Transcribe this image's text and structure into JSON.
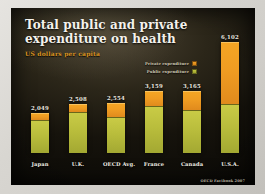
{
  "slide": {
    "title_line1": "Total public and private",
    "title_line2": "expenditure on health",
    "subtitle": "US dollars per capita",
    "source_note": "OECD Factbook 2007"
  },
  "legend": {
    "private_label": "Private expenditure",
    "public_label": "Public expenditure",
    "private_swatch_name": "private-expenditure-swatch",
    "public_swatch_name": "public-expenditure-swatch"
  },
  "colors": {
    "private": "#ef9c22",
    "public": "#b9bd3c",
    "title_text": "#f4f2ec",
    "subtitle_text": "#d9921f",
    "slide_background": "#16130c",
    "frame": "#d8d6d1"
  },
  "chart_data": {
    "type": "bar",
    "title": "Total public and private expenditure on health",
    "subtitle": "US dollars per capita",
    "xlabel": "",
    "ylabel": "US dollars per capita",
    "ylim": [
      0,
      6500
    ],
    "grid": false,
    "legend_position": "upper-right-inside",
    "stacked": true,
    "categories": [
      "Japan",
      "U.K.",
      "OECD Avg.",
      "France",
      "Canada",
      "U.S.A."
    ],
    "series": [
      {
        "name": "Public expenditure",
        "color": "#b9bd3c",
        "values": [
          1685,
          2090,
          1853,
          2398,
          2209,
          2724
        ]
      },
      {
        "name": "Private expenditure",
        "color": "#ef9c22",
        "values": [
          364,
          418,
          701,
          761,
          956,
          3378
        ]
      }
    ],
    "totals": [
      2049,
      2508,
      2554,
      3159,
      3165,
      6102
    ],
    "total_labels": [
      "2,049",
      "2,508",
      "2,554",
      "3,159",
      "3,165",
      "6,102"
    ],
    "annotations": [
      "OECD Factbook 2007"
    ]
  },
  "bars": [
    {
      "label": "Japan",
      "total_label": "2,049",
      "stack_pct": 33.6,
      "public_pct": 82.2,
      "private_pct": 17.8
    },
    {
      "label": "U.K.",
      "total_label": "2,508",
      "stack_pct": 41.1,
      "public_pct": 83.3,
      "private_pct": 16.7
    },
    {
      "label": "OECD Avg.",
      "total_label": "2,554",
      "stack_pct": 41.9,
      "public_pct": 72.6,
      "private_pct": 27.4
    },
    {
      "label": "France",
      "total_label": "3,159",
      "stack_pct": 51.8,
      "public_pct": 75.9,
      "private_pct": 24.1
    },
    {
      "label": "Canada",
      "total_label": "3,165",
      "stack_pct": 51.9,
      "public_pct": 69.8,
      "private_pct": 30.2
    },
    {
      "label": "U.S.A.",
      "total_label": "6,102",
      "stack_pct": 100.0,
      "public_pct": 44.6,
      "private_pct": 55.4
    }
  ]
}
